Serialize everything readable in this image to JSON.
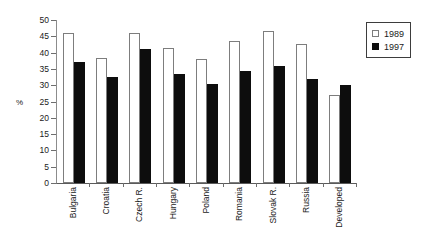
{
  "chart_data": {
    "type": "bar",
    "title": "",
    "xlabel": "",
    "ylabel": "%",
    "ylim": [
      0,
      50
    ],
    "ytick_step": 5,
    "yticks": [
      50,
      45,
      40,
      35,
      30,
      25,
      20,
      15,
      10,
      5,
      0
    ],
    "grid": false,
    "legend_position": "top-right",
    "categories": [
      "Bulgaria",
      "Croatia",
      "Czech R.",
      "Hungary",
      "Poland",
      "Romania",
      "Slovak R.",
      "Russia",
      "Developed"
    ],
    "series": [
      {
        "name": "1989",
        "color": "#ffffff",
        "edge_color": "#7d7d7d",
        "swatch": "legend-swatch-1989",
        "values": [
          46,
          38.5,
          46,
          41.5,
          38,
          43.5,
          46.5,
          42.5,
          27
        ]
      },
      {
        "name": "1997",
        "color": "#0d0d0d",
        "edge_color": "#0d0d0d",
        "swatch": "legend-swatch-1997",
        "values": [
          37,
          32.5,
          41,
          33.5,
          30.5,
          34.5,
          36,
          32,
          30
        ]
      }
    ]
  },
  "legend": {
    "items": [
      {
        "label": "1989"
      },
      {
        "label": "1997"
      }
    ]
  },
  "axes": {
    "y_title": "%"
  }
}
